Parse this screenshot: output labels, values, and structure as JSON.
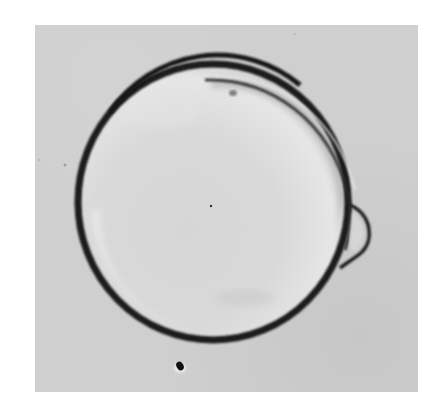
{
  "image": {
    "type": "micrograph",
    "description": "Grayscale light micrograph of a single spherical cell with a dark outer membrane ring, a detached inner membrane fold along the upper right, and a small dark particle below the cell",
    "colors": {
      "page_background": "#ffffff",
      "field_background": "#cfcfcf",
      "cell_interior": "#dcdcdc",
      "membrane_dark": "#1a1a1a",
      "highlight": "#eeeeee"
    },
    "frame": {
      "x": 35,
      "y": 25,
      "width": 383,
      "height": 367
    },
    "cell": {
      "cx": 213,
      "cy": 202,
      "rx": 135,
      "ry": 138
    },
    "features": [
      {
        "name": "outer-membrane-ring",
        "shape": "circle"
      },
      {
        "name": "inner-membrane-fold",
        "position": "upper-right"
      },
      {
        "name": "membrane-bulge",
        "position": "right",
        "x": 365,
        "y": 235
      },
      {
        "name": "interior-dot",
        "x": 211,
        "y": 206
      },
      {
        "name": "debris-particle",
        "x": 178,
        "y": 366
      }
    ]
  }
}
